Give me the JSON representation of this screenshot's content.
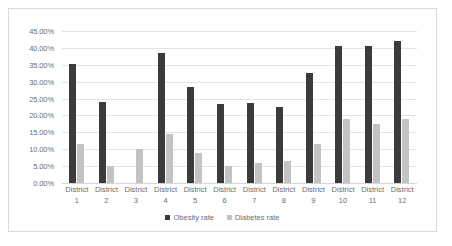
{
  "chart_data": {
    "type": "bar",
    "title": "",
    "xlabel": "",
    "ylabel": "",
    "categories": [
      "District 1",
      "District 2",
      "District 3",
      "District 4",
      "District 5",
      "District 6",
      "District 7",
      "District 8",
      "District 9",
      "District 10",
      "District 11",
      "District 12"
    ],
    "category_lines": [
      [
        "District",
        "1"
      ],
      [
        "District",
        "2"
      ],
      [
        "District",
        "3"
      ],
      [
        "District",
        "4"
      ],
      [
        "District",
        "5"
      ],
      [
        "District",
        "6"
      ],
      [
        "District",
        "7"
      ],
      [
        "District",
        "8"
      ],
      [
        "District",
        "9"
      ],
      [
        "District",
        "10"
      ],
      [
        "District",
        "11"
      ],
      [
        "District",
        "12"
      ]
    ],
    "series": [
      {
        "name": "Obesity rate",
        "color": "#3b3b3b",
        "values": [
          35.3,
          24.0,
          null,
          38.5,
          28.5,
          23.5,
          23.8,
          22.5,
          32.5,
          40.5,
          40.5,
          42.0
        ]
      },
      {
        "name": "Diabetes rate",
        "color": "#c3c3c3",
        "values": [
          11.5,
          5.0,
          10.0,
          14.5,
          9.0,
          5.0,
          6.0,
          6.5,
          11.5,
          19.0,
          17.5,
          19.0
        ]
      }
    ],
    "ylim": [
      0,
      45
    ],
    "ytick_step": 5,
    "ytick_labels": [
      "0.00%",
      "5.00%",
      "10.00%",
      "15.00%",
      "20.00%",
      "25.00%",
      "30.00%",
      "35.00%",
      "40.00%",
      "45.00%"
    ],
    "grid": true,
    "legend_position": "bottom"
  }
}
